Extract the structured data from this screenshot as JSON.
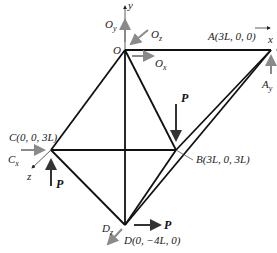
{
  "diagram": {
    "type": "space-truss",
    "nodes": {
      "O": {
        "label": "O",
        "coords": ""
      },
      "A": {
        "label": "A(3L, 0, 0)"
      },
      "B": {
        "label": "B(3L, 0, 3L)"
      },
      "C": {
        "label": "C(0, 0, 3L)"
      },
      "D": {
        "label": "D(0, −4L, 0)"
      }
    },
    "members": [
      "O-A",
      "O-B",
      "O-C",
      "O-D",
      "C-B",
      "C-D",
      "B-D",
      "A-B",
      "A-D"
    ],
    "axes": {
      "x": "x",
      "y": "y",
      "z": "z"
    },
    "reactions": {
      "Ox": "O",
      "Ox_sub": "x",
      "Oy": "O",
      "Oy_sub": "y",
      "Oz": "O",
      "Oz_sub": "z",
      "Ay": "A",
      "Ay_sub": "y",
      "Cx": "C",
      "Cx_sub": "x",
      "Dz": "D",
      "Dz_sub": "z"
    },
    "loads": {
      "at_B": "P",
      "at_C": "P",
      "at_D": "P"
    },
    "colors": {
      "member": "#111111",
      "reaction": "#8a8a8a",
      "load": "#333333"
    }
  }
}
